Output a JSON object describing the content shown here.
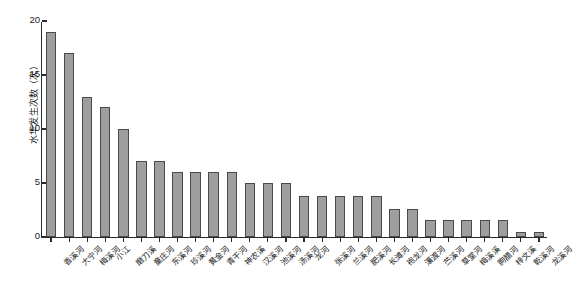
{
  "chart_data": {
    "type": "bar",
    "title": "",
    "xlabel": "",
    "ylabel": "水华发生次数（次）",
    "ylim": [
      0,
      20
    ],
    "yticks": [
      0,
      5,
      10,
      15,
      20
    ],
    "grid": false,
    "legend": null,
    "bar_color": "#9e9e9e",
    "bar_edge_color": "#4a4a4a",
    "categories": [
      "香溪河",
      "大宁河",
      "梅溪河",
      "小江",
      "磨刀溪",
      "童庄河",
      "东溪河",
      "珍溪河",
      "黄金河",
      "青干河",
      "神农溪",
      "汉溪河",
      "池溪河",
      "汤溪河",
      "龙河",
      "张溪河",
      "兰溪河",
      "肥溪河",
      "长滩河",
      "袍龙河",
      "瀼渡河",
      "苎溪河",
      "草堂河",
      "梅溪溪",
      "朐腊河",
      "梓文溪",
      "乾溪河",
      "龙溪河"
    ],
    "values": [
      19,
      17,
      13,
      12,
      10,
      7,
      7,
      6,
      6,
      6,
      6,
      5,
      5,
      5,
      3.8,
      3.8,
      3.8,
      3.8,
      3.8,
      2.6,
      2.6,
      1.6,
      1.6,
      1.6,
      1.6,
      1.6,
      0.5,
      0.5
    ]
  }
}
